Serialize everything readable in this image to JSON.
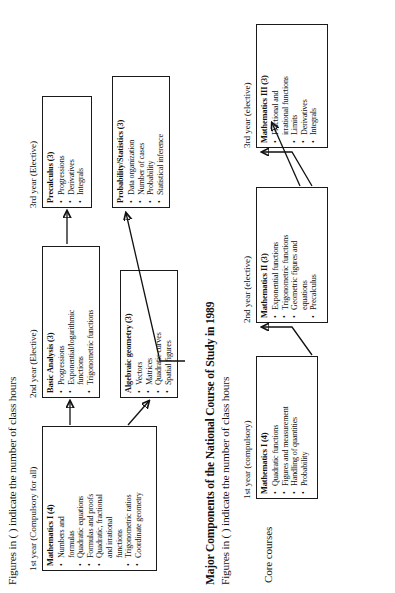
{
  "figure_top": {
    "note": "Figures in ( ) indicate the number of class hours",
    "columns": [
      {
        "caption": "1st year (Compulsory for all)"
      },
      {
        "caption": "2nd year (Elective)"
      },
      {
        "caption": "3rd year (Elective)"
      }
    ],
    "boxes": [
      {
        "title": "Mathematics I (4)",
        "items": [
          "Numbers and",
          "formulas",
          "Quadratic equations",
          "Formulas and proofs",
          "Quadratic, fractional",
          "and irrational",
          "functions",
          "Trigonometric ratios",
          "Coordinate geometry"
        ],
        "bullet_flags": [
          true,
          false,
          true,
          true,
          true,
          false,
          false,
          true,
          true
        ]
      },
      {
        "title": "Basic Analysis (3)",
        "items": [
          "Progressions",
          "Exponential/logarithmic",
          "functions",
          "Trigonometric functions"
        ],
        "bullet_flags": [
          true,
          true,
          false,
          true
        ]
      },
      {
        "title": "Algebraic geometry (3)",
        "items": [
          "Vectors",
          "Matrices",
          "Quadratic curves",
          "Spatial figures"
        ],
        "bullet_flags": [
          true,
          true,
          true,
          true
        ]
      },
      {
        "title": "Precalculus (3)",
        "items": [
          "Progressions",
          "Derivatives",
          "Integrals"
        ],
        "bullet_flags": [
          true,
          true,
          true
        ]
      },
      {
        "title": "Probability/Statistics (3)",
        "items": [
          "Data organization",
          "Number of cases",
          "Probability",
          "Statistical inference"
        ],
        "bullet_flags": [
          true,
          true,
          true,
          true
        ]
      }
    ]
  },
  "figure_bottom": {
    "title": "Major Components of the National Course of Study in 1989",
    "note": "Figures in ( ) indicate the number of class hours",
    "side_label": "Core courses",
    "columns": [
      {
        "caption": "1st year (compulsory)"
      },
      {
        "caption": "2nd year (elective)"
      },
      {
        "caption": "3rd year (elective)"
      }
    ],
    "boxes": [
      {
        "title": "Mathematics I (4)",
        "items": [
          "Quadratic functions",
          "Figures and measurement",
          "Handling of quantities",
          "Probability"
        ],
        "bullet_flags": [
          true,
          true,
          true,
          true
        ]
      },
      {
        "title": "Mathematics II (3)",
        "items": [
          "Exponential functions",
          "Trigonometric functions",
          "Geometric figures and",
          "equations",
          "Precalculus"
        ],
        "bullet_flags": [
          true,
          true,
          true,
          false,
          true
        ]
      },
      {
        "title": "Mathematics III (3)",
        "items": [
          "Fractional and",
          "irrational functions",
          "Limits",
          "Derivatives",
          "Integrals"
        ],
        "bullet_flags": [
          true,
          false,
          true,
          true,
          true
        ]
      }
    ]
  }
}
